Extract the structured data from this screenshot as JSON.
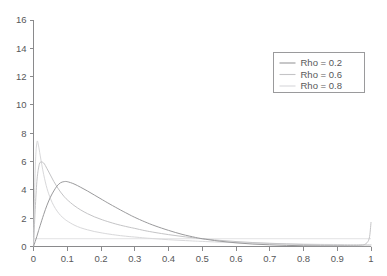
{
  "chart_data": {
    "type": "line",
    "title": "",
    "xlabel": "",
    "ylabel": "",
    "xlim": [
      0,
      1
    ],
    "ylim": [
      0,
      16
    ],
    "grid": false,
    "legend_position": "upper right",
    "x_ticks": [
      "0",
      "0.1",
      "0.2",
      "0.3",
      "0.4",
      "0.5",
      "0.6",
      "0.7",
      "0.8",
      "0.9",
      "1"
    ],
    "x_tick_values": [
      0,
      0.1,
      0.2,
      0.3,
      0.4,
      0.5,
      0.6,
      0.7,
      0.8,
      0.9,
      1
    ],
    "y_ticks": [
      "0",
      "2",
      "4",
      "6",
      "8",
      "10",
      "12",
      "14",
      "16"
    ],
    "y_tick_values": [
      0,
      2,
      4,
      6,
      8,
      10,
      12,
      14,
      16
    ],
    "x": [
      0.0,
      0.005,
      0.01,
      0.015,
      0.02,
      0.03,
      0.04,
      0.05,
      0.06,
      0.07,
      0.08,
      0.09,
      0.1,
      0.12,
      0.14,
      0.16,
      0.18,
      0.2,
      0.22,
      0.25,
      0.28,
      0.3,
      0.33,
      0.36,
      0.4,
      0.44,
      0.48,
      0.5,
      0.55,
      0.6,
      0.65,
      0.7,
      0.75,
      0.8,
      0.85,
      0.9,
      0.94,
      0.97,
      0.985,
      0.995,
      1.0
    ],
    "series": [
      {
        "name": "Rho = 0.2",
        "label": "Rho = 0.2",
        "color": "#9a9a9c",
        "values": [
          0.0,
          0.35,
          0.72,
          1.12,
          1.5,
          2.25,
          2.92,
          3.48,
          3.92,
          4.28,
          4.5,
          4.58,
          4.58,
          4.42,
          4.18,
          3.92,
          3.64,
          3.36,
          3.08,
          2.68,
          2.3,
          2.06,
          1.74,
          1.46,
          1.14,
          0.86,
          0.64,
          0.55,
          0.38,
          0.26,
          0.17,
          0.12,
          0.08,
          0.05,
          0.04,
          0.03,
          0.02,
          0.02,
          0.02,
          0.02,
          0.02
        ]
      },
      {
        "name": "Rho = 0.6",
        "label": "Rho = 0.6",
        "color": "#c4c4c6",
        "values": [
          0.0,
          2.6,
          4.6,
          5.55,
          5.95,
          5.9,
          5.5,
          5.05,
          4.6,
          4.2,
          3.85,
          3.55,
          3.3,
          2.9,
          2.58,
          2.32,
          2.1,
          1.92,
          1.76,
          1.55,
          1.38,
          1.28,
          1.12,
          0.99,
          0.84,
          0.71,
          0.6,
          0.55,
          0.44,
          0.35,
          0.28,
          0.23,
          0.18,
          0.14,
          0.11,
          0.09,
          0.08,
          0.1,
          0.2,
          0.6,
          1.7
        ]
      },
      {
        "name": "Rho = 0.8",
        "label": "Rho = 0.8",
        "color": "#d8d8da",
        "values": [
          0.0,
          5.4,
          7.35,
          7.1,
          6.4,
          5.1,
          4.1,
          3.4,
          2.88,
          2.5,
          2.2,
          1.98,
          1.8,
          1.52,
          1.32,
          1.18,
          1.06,
          0.97,
          0.89,
          0.79,
          0.71,
          0.67,
          0.6,
          0.55,
          0.48,
          0.43,
          0.38,
          0.36,
          0.31,
          0.27,
          0.24,
          0.21,
          0.19,
          0.17,
          0.15,
          0.14,
          0.13,
          0.13,
          0.13,
          0.13,
          0.14
        ]
      }
    ]
  },
  "legend": {
    "entries": [
      {
        "label": "Rho = 0.2"
      },
      {
        "label": "Rho = 0.6"
      },
      {
        "label": "Rho = 0.8"
      }
    ]
  },
  "colors": {
    "axis": "#8a8a8c",
    "tick_label": "#58585a",
    "legend_border": "#9a9a9c",
    "background": "#ffffff"
  }
}
